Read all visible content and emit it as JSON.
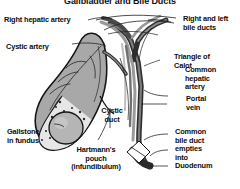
{
  "figure": {
    "title": "Gallbladder and Bile Ducts",
    "type": "anatomical-diagram",
    "background_color": "#ffffff",
    "ink_color": "#0d0d0d",
    "organ_fill_color": "#a8a8a8",
    "duct_fill_color": "#3a3a3a",
    "stone_fill_color": "#b5b5b5"
  },
  "labels": {
    "right_hepatic_artery": "Right hepatic artery",
    "cystic_artery": "Cystic artery",
    "gallstone_in_fundus": "Gallstone\nin fundus",
    "hartmanns_pouch": "Hartmann's\npouch\n(infundibulum)",
    "cystic_duct": "Cystic\nduct",
    "right_and_left_bile_ducts": "Right and left\nbile ducts",
    "triangle_of_calot": "Triangle of\nCalot",
    "common_hepatic_artery": "Common\nhepatic\nartery",
    "portal_vein": "Portal\nvein",
    "common_bile_duct": "Common\nbile duct\nempties\ninto\nDuodenum"
  }
}
